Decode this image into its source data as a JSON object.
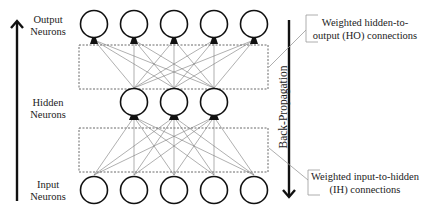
{
  "layers": {
    "output": {
      "label_line1": "Output",
      "label_line2": "Neurons",
      "count": 5
    },
    "hidden": {
      "label_line1": "Hidden",
      "label_line2": "Neurons",
      "count": 3
    },
    "input": {
      "label_line1": "Input",
      "label_line2": "Neurons",
      "count": 5
    }
  },
  "annotations": {
    "ho": {
      "line1": "Weighted hidden-to-",
      "line2": "output (HO) connections"
    },
    "ih": {
      "line1": "Weighted input-to-hidden",
      "line2": "(IH) connections"
    },
    "backprop": "Back-Propagation"
  },
  "colors": {
    "stroke": "#111111",
    "edge": "#777777",
    "dash": "#444444"
  }
}
